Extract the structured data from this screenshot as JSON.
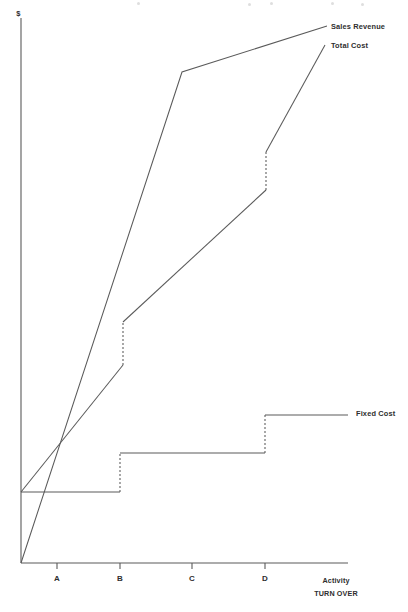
{
  "page": {
    "background_color": "#ffffff",
    "line_color": "#5a5a5a",
    "text_color": "#2e2e2e"
  },
  "axes": {
    "y_label": "$",
    "x_label_primary": "Activity",
    "x_label_secondary": "TURN OVER",
    "x_ticks": [
      {
        "label": "A",
        "x": 57
      },
      {
        "label": "B",
        "x": 120
      },
      {
        "label": "C",
        "x": 192
      },
      {
        "label": "D",
        "x": 265
      }
    ],
    "y_axis_x": 21,
    "y_axis_top": 18,
    "x_axis_y": 563,
    "x_axis_right": 348
  },
  "series_labels": {
    "sales_revenue": "Sales Revenue",
    "total_cost": "Total Cost",
    "fixed_cost": "Fixed Cost"
  },
  "chart_data": {
    "type": "line",
    "xlabel": "Activity / TURN OVER",
    "ylabel": "$",
    "grid": false,
    "legend_position": "right-inline",
    "xlim": [
      21,
      348
    ],
    "ylim": [
      563,
      18
    ],
    "x_tick_labels": [
      "A",
      "B",
      "C",
      "D"
    ],
    "x_tick_positions": [
      57,
      120,
      192,
      265
    ],
    "annotations": [
      {
        "text": "Break-even point where Sales Revenue crosses Total Cost",
        "x": 58,
        "y": 440
      }
    ],
    "series": [
      {
        "name": "Sales Revenue",
        "label_x": 331,
        "label_y": 29,
        "stepped": false,
        "segments": [
          {
            "points": [
              [
                21,
                563
              ],
              [
                182,
                72
              ],
              [
                327,
                26
              ]
            ]
          }
        ],
        "jumps": []
      },
      {
        "name": "Total Cost",
        "label_x": 331,
        "label_y": 48,
        "stepped": true,
        "segments": [
          {
            "points": [
              [
                21,
                492
              ],
              [
                123,
                365
              ]
            ]
          },
          {
            "points": [
              [
                123,
                322
              ],
              [
                266,
                190
              ]
            ]
          },
          {
            "points": [
              [
                266,
                152
              ],
              [
                325,
                45
              ]
            ]
          }
        ],
        "jumps": [
          {
            "x": 123,
            "y1": 365,
            "y2": 322
          },
          {
            "x": 266,
            "y1": 190,
            "y2": 152
          }
        ]
      },
      {
        "name": "Fixed Cost",
        "label_x": 356,
        "label_y": 416,
        "stepped": true,
        "segments": [
          {
            "points": [
              [
                21,
                492
              ],
              [
                120,
                492
              ]
            ]
          },
          {
            "points": [
              [
                120,
                453
              ],
              [
                265,
                453
              ]
            ]
          },
          {
            "points": [
              [
                265,
                415
              ],
              [
                348,
                415
              ]
            ]
          }
        ],
        "jumps": [
          {
            "x": 120,
            "y1": 492,
            "y2": 453
          },
          {
            "x": 265,
            "y1": 453,
            "y2": 415
          }
        ]
      }
    ]
  }
}
